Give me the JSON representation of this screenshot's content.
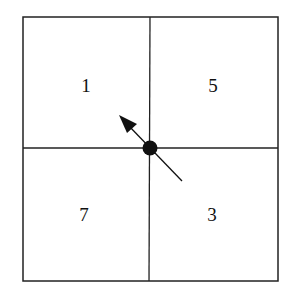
{
  "diagram": {
    "type": "2x2-grid-with-direction-arrow",
    "cells": [
      {
        "position": "top-left",
        "label": "1"
      },
      {
        "position": "top-right",
        "label": "5"
      },
      {
        "position": "bottom-left",
        "label": "7"
      },
      {
        "position": "bottom-right",
        "label": "3"
      }
    ],
    "center_marker": "filled-dot",
    "arrow": {
      "from": "bottom-right",
      "to": "top-left",
      "direction": "northwest"
    },
    "colors": {
      "stroke": "#222222",
      "background": "#ffffff"
    }
  }
}
